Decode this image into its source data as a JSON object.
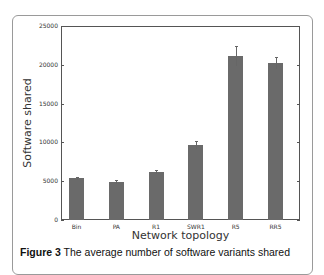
{
  "chart_data": {
    "type": "bar",
    "title": "",
    "xlabel": "Network topology",
    "ylabel": "Software shared",
    "categories": [
      "Bin",
      "PA",
      "R1",
      "SWR1",
      "R5",
      "RR5"
    ],
    "values": [
      5400,
      4900,
      6200,
      9700,
      21100,
      20200
    ],
    "error": [
      200,
      300,
      300,
      500,
      1300,
      800
    ],
    "ylim": [
      0,
      25000
    ],
    "yticks": [
      0,
      5000,
      10000,
      15000,
      20000,
      25000
    ],
    "grid": false,
    "bar_color": "#6a6a6a"
  },
  "axis": {
    "yticks": [
      "0",
      "5000",
      "10000",
      "15000",
      "20000",
      "25000"
    ],
    "xticks": [
      "Bin",
      "PA",
      "R1",
      "SWR1",
      "R5",
      "RR5"
    ],
    "xlabel": "Network topology",
    "ylabel": "Software shared"
  },
  "caption": {
    "label": "Figure 3",
    "text": " The average number of software variants shared"
  }
}
